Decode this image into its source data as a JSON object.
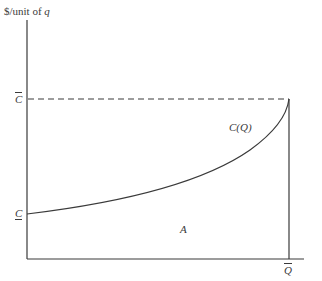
{
  "diagram": {
    "y_axis_label_prefix": "$/unit of ",
    "y_axis_label_var": "q",
    "c_bar_label": "C",
    "c_underbar_label": "C",
    "curve_label": "C(Q)",
    "area_label": "A",
    "q_bar_label": "Q"
  },
  "colors": {
    "line": "#3a3a3a",
    "background": "#ffffff"
  }
}
